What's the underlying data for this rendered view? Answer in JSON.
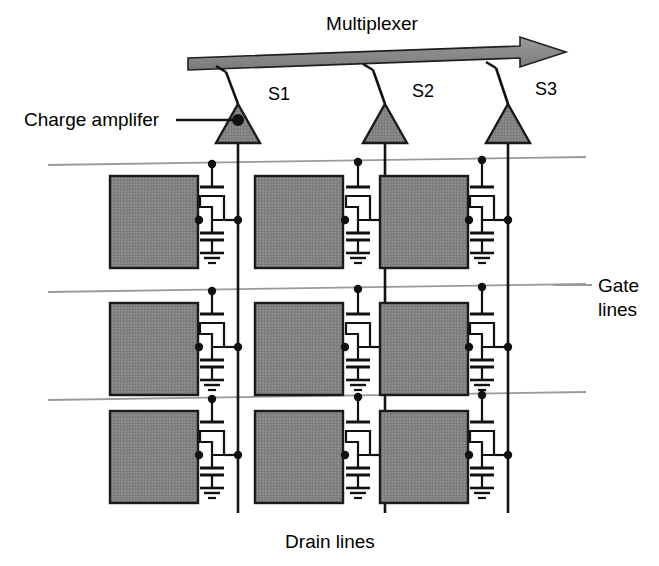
{
  "figure": {
    "type": "schematic-diagram",
    "background_color": "#ffffff"
  },
  "colors": {
    "pixel_fill": "#808080",
    "pixel_stroke": "#1a1a1a",
    "amplifier_fill": "#808080",
    "amplifier_stroke": "#1a1a1a",
    "multiplexer_fill": "#8c8c8c",
    "multiplexer_stroke": "#1a1a1a",
    "gate_line": "#999999",
    "drain_line": "#111111",
    "wire": "#111111",
    "text": "#000000"
  },
  "labels": {
    "multiplexer": "Multiplexer",
    "charge_amplifier": "Charge amplifer",
    "gate_lines_line1": "Gate",
    "gate_lines_line2": "lines",
    "drain_lines": "Drain lines"
  },
  "multiplexer": {
    "label": "Multiplexer",
    "direction": "left-to-right",
    "bar": {
      "x1": 188,
      "y1": 64,
      "x2": 520,
      "y2": 52,
      "thickness": 11
    },
    "arrow_tip_x": 566,
    "label_pos": {
      "x": 372,
      "y": 22
    }
  },
  "amplifiers": [
    {
      "id": "S1",
      "switch_label": "S1",
      "x": 238,
      "label_x": 268,
      "label_y": 96
    },
    {
      "id": "S2",
      "switch_label": "S2",
      "x": 385,
      "label_x": 412,
      "label_y": 93
    },
    {
      "id": "S3",
      "switch_label": "S3",
      "x": 508,
      "label_x": 535,
      "label_y": 90
    }
  ],
  "amplifier_geometry": {
    "triangle_half_width": 22,
    "triangle_apex_y": 104,
    "triangle_base_y": 143,
    "dot_radius": 6,
    "switch_pivot_y": 104,
    "switch_arm_end_dx": -12,
    "switch_arm_end_dy": -32,
    "switch_tip_dx": -22,
    "switch_tip_dy": -38
  },
  "gate_lines": [
    {
      "index": 1,
      "x1": 48,
      "y1": 165,
      "x2": 586,
      "y2": 157
    },
    {
      "index": 2,
      "x1": 48,
      "y1": 292,
      "x2": 586,
      "y2": 284
    },
    {
      "index": 3,
      "x1": 48,
      "y1": 400,
      "x2": 586,
      "y2": 392
    }
  ],
  "gate_lines_label": {
    "line1": "Gate",
    "line2": "lines",
    "x": 598,
    "y1": 286,
    "y2": 310,
    "leader": {
      "x1": 553,
      "y1": 285,
      "x2": 590,
      "y2": 285
    }
  },
  "drain_lines": [
    {
      "column": 1,
      "x": 238,
      "y_top": 143,
      "y_bottom": 513
    },
    {
      "column": 2,
      "x": 385,
      "y_top": 143,
      "y_bottom": 513
    },
    {
      "column": 3,
      "x": 508,
      "y_top": 143,
      "y_bottom": 513
    }
  ],
  "drain_lines_label": {
    "text": "Drain lines",
    "x": 330,
    "y": 540
  },
  "charge_amplifier_label": {
    "text": "Charge amplifer",
    "x": 24,
    "y": 124,
    "leader": {
      "x1": 176,
      "y1": 119,
      "x2": 238,
      "y2": 119
    }
  },
  "pixel_grid": {
    "rows": 3,
    "columns": 3,
    "block_width": 88,
    "block_height": 92,
    "column_block_x": [
      110,
      255,
      380
    ],
    "row_block_y": [
      176,
      303,
      411
    ],
    "row_gate_y": [
      165,
      292,
      400
    ],
    "column_drain_x": [
      238,
      385,
      508
    ]
  },
  "cell_components": {
    "transistor": "thin-film-transistor",
    "capacitor": "storage-capacitor",
    "ground": "ground-symbol",
    "contacts": "junction-dots"
  }
}
